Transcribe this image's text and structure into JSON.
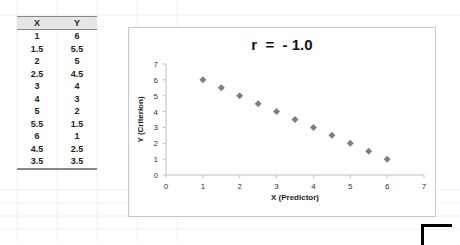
{
  "table": {
    "headers": [
      "X",
      "Y"
    ],
    "rows": [
      [
        "1",
        "6"
      ],
      [
        "1.5",
        "5.5"
      ],
      [
        "2",
        "5"
      ],
      [
        "2.5",
        "4.5"
      ],
      [
        "3",
        "4"
      ],
      [
        "4",
        "3"
      ],
      [
        "5",
        "2"
      ],
      [
        "5.5",
        "1.5"
      ],
      [
        "6",
        "1"
      ],
      [
        "4.5",
        "2.5"
      ],
      [
        "3.5",
        "3.5"
      ]
    ]
  },
  "chart_data": {
    "type": "scatter",
    "title": "r  =  - 1.0",
    "xlabel": "X (Predictor)",
    "ylabel": "Y (Criterion)",
    "xlim": [
      0,
      7
    ],
    "ylim": [
      0,
      7
    ],
    "x_ticks": [
      "0",
      "1",
      "2",
      "3",
      "4",
      "5",
      "6",
      "7"
    ],
    "y_ticks": [
      "0",
      "1",
      "2",
      "3",
      "4",
      "5",
      "6",
      "7"
    ],
    "grid": false,
    "legend": "none",
    "marker_color": "#7f7f7f",
    "series": [
      {
        "name": "Y",
        "x": [
          1,
          1.5,
          2,
          2.5,
          3,
          4,
          5,
          5.5,
          6,
          4.5,
          3.5
        ],
        "y": [
          6,
          5.5,
          5,
          4.5,
          4,
          3,
          2,
          1.5,
          1,
          2.5,
          3.5
        ]
      }
    ]
  }
}
